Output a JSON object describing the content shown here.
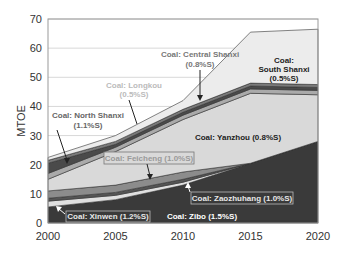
{
  "chart_data": {
    "type": "area",
    "stacked": true,
    "title": "",
    "xlabel": "",
    "ylabel": "MTOE",
    "x": [
      2000,
      2005,
      2010,
      2015,
      2020
    ],
    "xticks": [
      "2000",
      "2005",
      "2010",
      "2015",
      "2020"
    ],
    "yticks": [
      "0",
      "10",
      "20",
      "30",
      "40",
      "50",
      "60",
      "70"
    ],
    "xlim": [
      2000,
      2020
    ],
    "ylim": [
      0,
      70
    ],
    "grid": "horizontal",
    "legend": "none (inline annotations)",
    "series": [
      {
        "name": "Coal: Zibo (1.5%S)",
        "values": [
          5.5,
          8.0,
          13.0,
          20.5,
          28.0
        ],
        "color": "#3a3a3a",
        "label_color": "#ffffff"
      },
      {
        "name": "Coal: Xinwen (1.2%S)",
        "values": [
          2.0,
          1.5,
          1.0,
          0.0,
          0.0
        ],
        "color": "#e0e0e0",
        "label_color": "#e8e8e8"
      },
      {
        "name": "Coal: Zaozhuhang (1.0%S)",
        "values": [
          1.0,
          1.0,
          1.0,
          0.0,
          0.0
        ],
        "color": "#555555",
        "label_color": "#e8e8e8"
      },
      {
        "name": "Coal: Feicheng (1.0%S)",
        "values": [
          2.5,
          2.5,
          2.5,
          0.0,
          0.0
        ],
        "color": "#8c8c8c",
        "label_color": "#9a9a9a"
      },
      {
        "name": "Coal: Yanzhou (0.8%S)",
        "values": [
          4.0,
          11.5,
          18.0,
          24.0,
          16.0
        ],
        "color": "#d9d9d9",
        "label_color": "#222222"
      },
      {
        "name": "Coal: Longkou (0.5%S)",
        "values": [
          2.0,
          1.5,
          1.5,
          1.5,
          1.5
        ],
        "color": "#aaaaaa",
        "label_color": "#bbbbbb"
      },
      {
        "name": "Coal: North Shanxi (1.1%S)",
        "values": [
          3.5,
          1.0,
          1.0,
          1.0,
          1.0
        ],
        "color": "#4a4a4a",
        "label_color": "#666666"
      },
      {
        "name": "Coal: Central Shanxi (0.8%S)",
        "values": [
          1.0,
          1.0,
          1.0,
          1.0,
          1.0
        ],
        "color": "#7a7a7a",
        "label_color": "#777777"
      },
      {
        "name": "Coal: South Shanxi (0.5%S)",
        "values": [
          1.0,
          2.0,
          3.0,
          17.5,
          19.0
        ],
        "color": "#ececec",
        "label_color": "#222222"
      }
    ],
    "totals": [
      22.5,
      30.0,
      42.0,
      48.0,
      66.5
    ],
    "annotations": [
      {
        "text": "Coal: Central Shanxi",
        "text2": "(0.8%S)"
      },
      {
        "text": "Coal:",
        "text2": "South Shanxi",
        "text3": "(0.5%S)"
      },
      {
        "text": "Coal: Longkou",
        "text2": "(0.5%S)"
      },
      {
        "text": "Coal: North Shanxi",
        "text2": "(1.1%S)"
      },
      {
        "text": "Coal: Yanzhou (0.8%S)"
      },
      {
        "text": "Coal: Feicheng (1.0%S)"
      },
      {
        "text": "Coal: Zaozhuhang (1.0%S)"
      },
      {
        "text": "Coal: Xinwen (1.2%S)"
      },
      {
        "text": "Coal: Zibo (1.5%S)"
      }
    ]
  }
}
